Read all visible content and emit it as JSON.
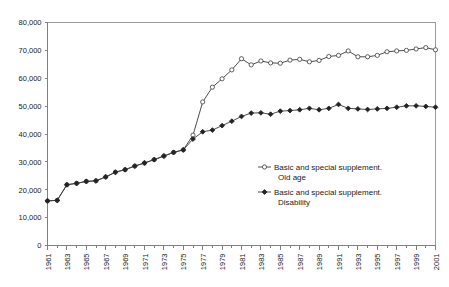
{
  "chart_data": {
    "type": "line",
    "title": "",
    "subtitle": "",
    "xlabel": "",
    "ylabel": "",
    "grid": false,
    "legend_position": "inside-center-right",
    "x": [
      1961,
      1962,
      1963,
      1964,
      1965,
      1966,
      1967,
      1968,
      1969,
      1970,
      1971,
      1972,
      1973,
      1974,
      1975,
      1976,
      1977,
      1978,
      1979,
      1980,
      1981,
      1982,
      1983,
      1984,
      1985,
      1986,
      1987,
      1988,
      1989,
      1990,
      1991,
      1992,
      1993,
      1994,
      1995,
      1996,
      1997,
      1998,
      1999,
      2000,
      2001
    ],
    "xtick_labels": [
      "1961",
      "1963",
      "1965",
      "1967",
      "1969",
      "1971",
      "1973",
      "1975",
      "1977",
      "1979",
      "1981",
      "1983",
      "1985",
      "1987",
      "1989",
      "1991",
      "1993",
      "1995",
      "1997",
      "1999",
      "2001"
    ],
    "xlim": [
      1961,
      2001
    ],
    "ylim": [
      0,
      80000
    ],
    "ytick_labels": [
      "0",
      "10,000",
      "20,000",
      "30,000",
      "40,000",
      "50,000",
      "60,000",
      "70,000",
      "80,000"
    ],
    "ytick_values": [
      0,
      10000,
      20000,
      30000,
      40000,
      50000,
      60000,
      70000,
      80000
    ],
    "series": [
      {
        "name": "Basic and special supplement. Old age",
        "marker": "open-circle",
        "color": "#3a3a3a",
        "values": [
          16000,
          16200,
          21800,
          22300,
          23000,
          23200,
          24600,
          26300,
          27200,
          28500,
          29600,
          30800,
          32100,
          33400,
          34300,
          39600,
          51500,
          56800,
          59800,
          63000,
          67000,
          64800,
          66200,
          65500,
          65400,
          66500,
          66800,
          65900,
          66400,
          67800,
          68200,
          69800,
          67700,
          67700,
          68200,
          69500,
          69800,
          70000,
          70500,
          71000,
          70200
        ]
      },
      {
        "name": "Basic and special supplement. Disability",
        "marker": "filled-diamond",
        "color": "#222222",
        "values": [
          16000,
          16200,
          21800,
          22300,
          23000,
          23200,
          24600,
          26300,
          27200,
          28500,
          29600,
          30800,
          32100,
          33400,
          34300,
          38200,
          40800,
          41400,
          43000,
          44600,
          46300,
          47500,
          47600,
          47100,
          48200,
          48400,
          48700,
          49200,
          48700,
          49200,
          50600,
          49200,
          49000,
          48800,
          49000,
          49200,
          49600,
          50100,
          50100,
          49900,
          49600
        ]
      }
    ]
  },
  "legend": {
    "entries": [
      {
        "line1": "Basic and special supplement.",
        "line2": "Old age",
        "marker": "open-circle"
      },
      {
        "line1": "Basic and special supplement.",
        "line2": "Disability",
        "marker": "filled-diamond"
      }
    ]
  }
}
